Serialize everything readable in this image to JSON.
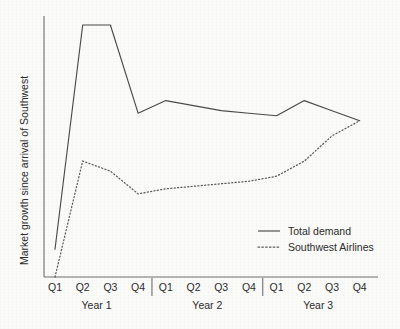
{
  "chart_data": {
    "type": "line",
    "title": "",
    "xlabel": "",
    "ylabel": "Market growth since arrival of Southwest",
    "grid": false,
    "legend_position": "inside-bottom-right",
    "ylim": [
      0,
      105
    ],
    "y_ticks_visible": false,
    "categories": [
      "Q1",
      "Q2",
      "Q3",
      "Q4",
      "Q1",
      "Q2",
      "Q3",
      "Q4",
      "Q1",
      "Q2",
      "Q3",
      "Q4"
    ],
    "group_labels": [
      "Year 1",
      "Year 2",
      "Year 3"
    ],
    "group_size": 4,
    "series": [
      {
        "name": "Total demand",
        "style": "solid",
        "color": "#4a4a4a",
        "values": [
          11,
          100,
          100,
          65,
          70,
          68,
          66,
          65,
          64,
          70,
          66,
          62
        ]
      },
      {
        "name": "Southwest Airlines",
        "style": "dotted",
        "color": "#5a5a5a",
        "values": [
          0,
          46,
          42,
          33,
          35,
          36,
          37,
          38,
          40,
          46,
          56,
          62
        ]
      }
    ]
  },
  "legend": {
    "entries": [
      {
        "label": "Total demand",
        "style": "solid"
      },
      {
        "label": "Southwest Airlines",
        "style": "dotted"
      }
    ]
  },
  "axis": {
    "y_title": "Market growth since arrival of Southwest",
    "x_tick_labels": [
      "Q1",
      "Q2",
      "Q3",
      "Q4",
      "Q1",
      "Q2",
      "Q3",
      "Q4",
      "Q1",
      "Q2",
      "Q3",
      "Q4"
    ],
    "x_group_labels": [
      "Year 1",
      "Year 2",
      "Year 3"
    ]
  },
  "colors": {
    "background": "#fbfbfa",
    "axis": "#6f6f6f",
    "text": "#2b2b2b",
    "total_demand": "#4a4a4a",
    "southwest_airlines": "#5a5a5a"
  }
}
